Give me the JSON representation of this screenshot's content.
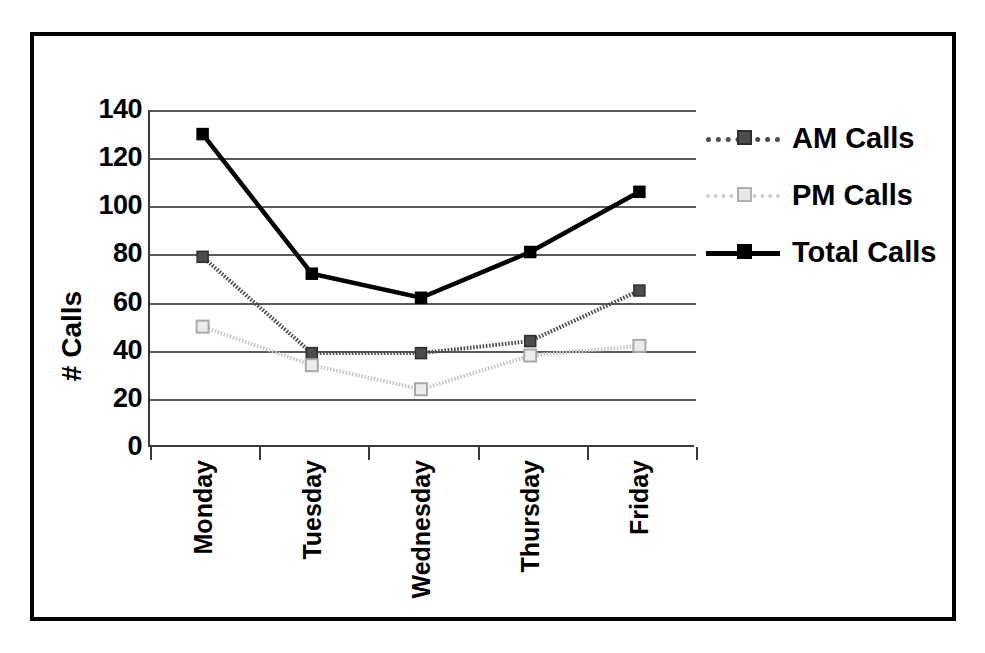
{
  "chart_data": {
    "type": "line",
    "title": "",
    "xlabel": "",
    "ylabel": "# Calls",
    "categories": [
      "Monday",
      "Tuesday",
      "Wednesday",
      "Thursday",
      "Friday"
    ],
    "ylim": [
      0,
      140
    ],
    "yticks": [
      140,
      120,
      100,
      80,
      60,
      40,
      20,
      0
    ],
    "grid": true,
    "legend_position": "right",
    "series": [
      {
        "name": "AM Calls",
        "values": [
          79,
          39,
          39,
          44,
          65
        ],
        "color": "#4c4c4c",
        "line_style": "dotted",
        "marker": "filled-square"
      },
      {
        "name": "PM Calls",
        "values": [
          50,
          34,
          24,
          38,
          42
        ],
        "color": "#c8c8c8",
        "line_style": "dotted",
        "marker": "open-square"
      },
      {
        "name": "Total Calls",
        "values": [
          130,
          72,
          62,
          81,
          106
        ],
        "color": "#000000",
        "line_style": "solid",
        "marker": "filled-square"
      }
    ]
  },
  "axis": {
    "y_title": "# Calls",
    "y_tick_labels": [
      "140",
      "120",
      "100",
      "80",
      "60",
      "40",
      "20",
      "0"
    ],
    "x_tick_labels": [
      "Monday",
      "Tuesday",
      "Wednesday",
      "Thursday",
      "Friday"
    ]
  },
  "legend": {
    "entries": [
      {
        "label": "AM Calls",
        "swatch": "am-series-key"
      },
      {
        "label": "PM Calls",
        "swatch": "pm-series-key"
      },
      {
        "label": "Total Calls",
        "swatch": "total-series-key"
      }
    ]
  },
  "colors": {
    "frame": "#000000",
    "grid": "#595959",
    "am": "#4c4c4c",
    "pm": "#c8c8c8",
    "total": "#000000",
    "background": "#ffffff"
  }
}
